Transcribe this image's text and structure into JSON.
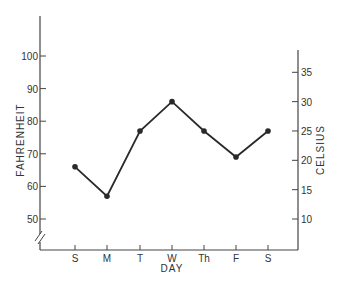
{
  "chart_data": {
    "type": "line",
    "title": "",
    "xlabel": "DAY",
    "ylabel": "FAHRENHEIT",
    "ylabel_right": "CELSIUS",
    "categories": [
      "S",
      "M",
      "T",
      "W",
      "Th",
      "F",
      "S"
    ],
    "series": [
      {
        "name": "Temperature (°F)",
        "values": [
          66,
          57,
          77,
          86,
          77,
          69,
          77
        ]
      }
    ],
    "ylim": [
      43,
      112
    ],
    "yticks": [
      50,
      60,
      70,
      80,
      90,
      100
    ],
    "yticks_right": [
      10,
      15,
      20,
      25,
      30,
      35
    ],
    "grid": false,
    "legend": "none",
    "axis_break": "left-axis-bottom"
  },
  "labels": {
    "xlabel": "DAY",
    "ylabel_left": "FAHRENHEIT",
    "ylabel_right": "CELSIUS"
  },
  "colors": {
    "line": "#2a2a2a",
    "axis": "#444444",
    "text": "#333333"
  }
}
